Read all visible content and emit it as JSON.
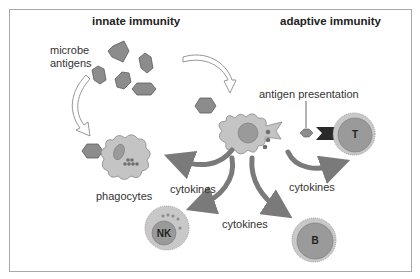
{
  "titles": {
    "innate": "innate immunity",
    "adaptive": "adaptive immunity"
  },
  "labels": {
    "microbe_line1": "microbe",
    "microbe_line2": "antigens",
    "antigen_presentation": "antigen presentation",
    "phagocytes": "phagocytes",
    "cytokines_left": "cytokines",
    "cytokines_right": "cytokines",
    "cytokines_bottom": "cytokines"
  },
  "cells": {
    "nk": "NK",
    "t": "T",
    "b": "B"
  },
  "colors": {
    "antigen_fill": "#8c8c8c",
    "cell_body": "#c4c4c4",
    "nucleus": "#9a9a9a",
    "arrow": "#7a7a7a",
    "receptor": "#2a2a2a",
    "frame": "#a8a8a8"
  }
}
